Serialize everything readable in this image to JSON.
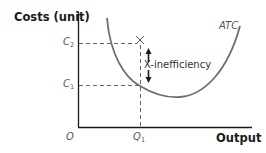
{
  "diagram": {
    "y_axis": {
      "label": "Costs (unit)"
    },
    "x_axis": {
      "label": "Output"
    },
    "origin_label": "O",
    "curve": {
      "label": "ATC"
    },
    "levels": {
      "c2": {
        "letter": "C",
        "sub": "2"
      },
      "c1": {
        "letter": "C",
        "sub": "1"
      }
    },
    "quantity": {
      "letter": "Q",
      "sub": "1"
    },
    "point_marker": "×",
    "annotation": "X-inefficiency",
    "colors": {
      "axis": "#1a1a1a",
      "curve": "#6e6e6e",
      "dashed": "#666666",
      "text": "#1a1a1a",
      "italic_label": "#555555"
    }
  }
}
